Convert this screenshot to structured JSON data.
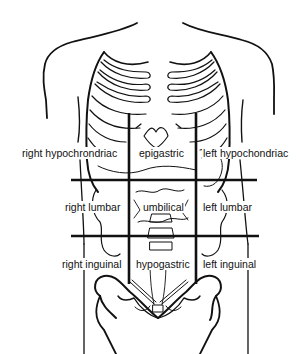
{
  "diagram": {
    "colors": {
      "line": "#111111",
      "background": "#ffffff"
    },
    "regions": {
      "row1": {
        "left": "right hypochrondriac",
        "center": "epigastric",
        "right": "left hypochondriac"
      },
      "row2": {
        "left": "right lumbar",
        "center": "umbilical",
        "right": "left lumbar"
      },
      "row3": {
        "left": "right inguinal",
        "center": "hypogastric",
        "right": "left inguinal"
      }
    },
    "grid": {
      "horizontal_lines": [
        {
          "name": "subcostal-plane",
          "y": 180,
          "x1": 71,
          "x2": 257
        },
        {
          "name": "intertubercular-plane",
          "y": 236,
          "x1": 71,
          "x2": 259
        }
      ],
      "vertical_lines": [
        {
          "name": "right-midclavicular-line",
          "x": 129,
          "y1": 113,
          "y2": 284
        },
        {
          "name": "left-midclavicular-line",
          "x": 196,
          "y1": 113,
          "y2": 284
        }
      ]
    }
  }
}
